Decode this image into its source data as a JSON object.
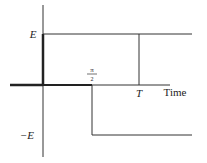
{
  "diagram": {
    "labels": {
      "e_positive": "E",
      "e_negative": "−E",
      "half_period_numerator": "π",
      "half_period_denominator": "2",
      "period": "T",
      "x_axis": "Time"
    },
    "colors": {
      "line": "#333333",
      "background": "#ffffff"
    }
  }
}
